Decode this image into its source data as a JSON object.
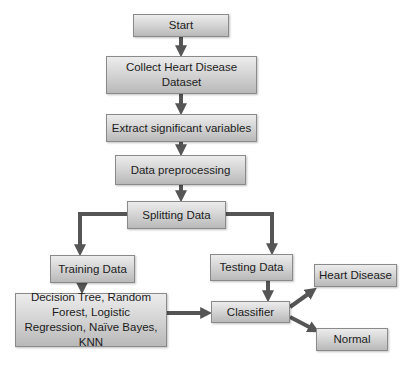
{
  "diagram": {
    "type": "flowchart",
    "colors": {
      "box_top": "#ececec",
      "box_bottom": "#b9b9b9",
      "border": "#8a8a8a",
      "arrow": "#555555",
      "text": "#1c1c1c"
    },
    "nodes": {
      "start": "Start",
      "collect": "Collect Heart Disease Dataset",
      "extract": "Extract significant variables",
      "preprocess": "Data preprocessing",
      "split": "Splitting Data",
      "training": "Training Data",
      "testing": "Testing Data",
      "models": "Decision Tree, Random Forest, Logistic Regression, Naïve Bayes, KNN",
      "classifier": "Classifier",
      "heart_disease": "Heart Disease",
      "normal": "Normal"
    },
    "edges": [
      [
        "start",
        "collect"
      ],
      [
        "collect",
        "extract"
      ],
      [
        "extract",
        "preprocess"
      ],
      [
        "preprocess",
        "split"
      ],
      [
        "split",
        "training"
      ],
      [
        "split",
        "testing"
      ],
      [
        "training",
        "models"
      ],
      [
        "models",
        "classifier"
      ],
      [
        "testing",
        "classifier"
      ],
      [
        "classifier",
        "heart_disease"
      ],
      [
        "classifier",
        "normal"
      ]
    ]
  }
}
